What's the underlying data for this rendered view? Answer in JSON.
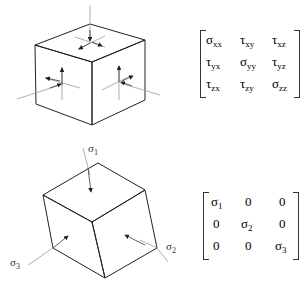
{
  "diagram": {
    "general_state": {
      "description": "Cube element with normal and shear stress arrows on each face",
      "matrix": [
        [
          {
            "base": "σ",
            "sub": "xx"
          },
          {
            "base": "τ",
            "sub": "xy"
          },
          {
            "base": "τ",
            "sub": "xz"
          }
        ],
        [
          {
            "base": "τ",
            "sub": "yx"
          },
          {
            "base": "σ",
            "sub": "yy"
          },
          {
            "base": "τ",
            "sub": "yz"
          }
        ],
        [
          {
            "base": "τ",
            "sub": "zx"
          },
          {
            "base": "τ",
            "sub": "zy"
          },
          {
            "base": "σ",
            "sub": "zz"
          }
        ]
      ]
    },
    "principal_state": {
      "description": "Rotated cube element aligned with principal directions",
      "labels": {
        "s1": {
          "base": "σ",
          "sub": "1"
        },
        "s2": {
          "base": "σ",
          "sub": "2"
        },
        "s3": {
          "base": "σ",
          "sub": "3"
        }
      },
      "matrix": [
        [
          {
            "base": "σ",
            "sub": "1"
          },
          {
            "base": "0",
            "sub": ""
          },
          {
            "base": "0",
            "sub": ""
          }
        ],
        [
          {
            "base": "0",
            "sub": ""
          },
          {
            "base": "σ",
            "sub": "2"
          },
          {
            "base": "0",
            "sub": ""
          }
        ],
        [
          {
            "base": "0",
            "sub": ""
          },
          {
            "base": "0",
            "sub": ""
          },
          {
            "base": "σ",
            "sub": "3"
          }
        ]
      ]
    }
  }
}
